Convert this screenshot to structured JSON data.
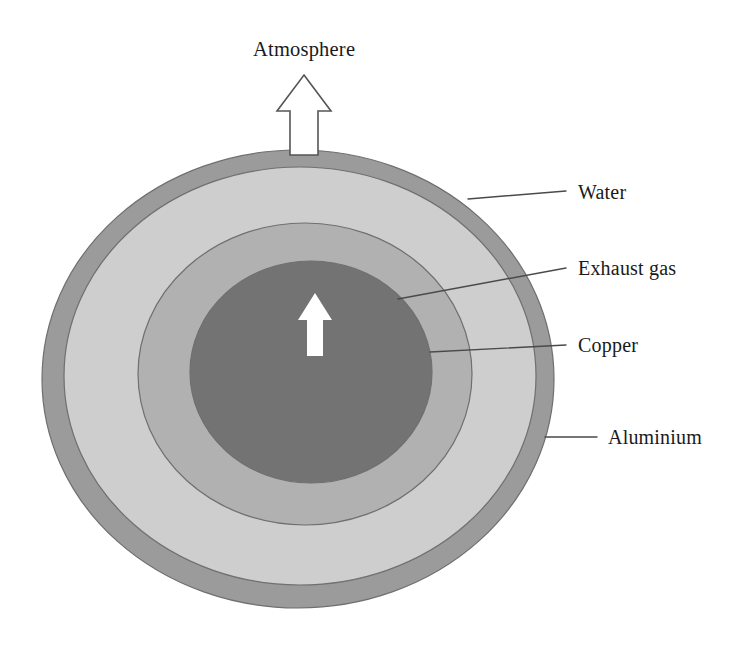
{
  "figure": {
    "title_visible": false,
    "background_color": "#ffffff",
    "type": "cross-section-diagram"
  },
  "labels": {
    "atmosphere": "Atmosphere",
    "water": "Water",
    "exhaust_gas": "Exhaust gas",
    "copper": "Copper",
    "aluminium": "Aluminium"
  },
  "layers": [
    {
      "name": "Aluminium",
      "role": "outer-shell",
      "color": "#9b9b9b",
      "order": 1
    },
    {
      "name": "Water",
      "role": "coolant-annulus",
      "color": "#cecece",
      "order": 2
    },
    {
      "name": "Copper",
      "role": "inner-tube-wall",
      "color": "#b1b1b1",
      "order": 3
    },
    {
      "name": "Exhaust gas",
      "role": "core-flow",
      "color": "#737373",
      "order": 4
    }
  ],
  "arrows": [
    {
      "name": "atmosphere-arrow",
      "style": "outlined",
      "direction": "up",
      "fill": "#ffffff",
      "stroke": "#555555",
      "points_to": "Atmosphere"
    },
    {
      "name": "exhaust-flow-arrow",
      "style": "filled",
      "direction": "up",
      "fill": "#ffffff",
      "stroke": "none",
      "points_to": "Exhaust gas"
    }
  ],
  "colors": {
    "outline": "#6f6f6f",
    "leader_line": "#4a4a4a",
    "text": "#1a1a1a",
    "arrow_fill": "#ffffff",
    "arrow_outline": "#555555"
  }
}
